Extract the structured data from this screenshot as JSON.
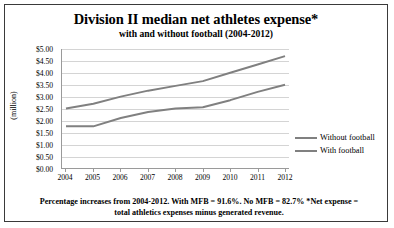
{
  "chart_data": {
    "type": "line",
    "title": "Division II median net athletes expense*",
    "subtitle": "with and without football (2004-2012)",
    "xlabel": "",
    "ylabel": "(million)",
    "categories": [
      "2004",
      "2005",
      "2006",
      "2007",
      "2008",
      "2009",
      "2010",
      "2011",
      "2012"
    ],
    "series": [
      {
        "name": "Without football",
        "color": "#808080",
        "values": [
          2.5,
          2.7,
          3.0,
          3.25,
          3.45,
          3.65,
          4.0,
          4.35,
          4.7
        ]
      },
      {
        "name": "With football",
        "color": "#808080",
        "values": [
          1.75,
          1.75,
          2.1,
          2.35,
          2.5,
          2.55,
          2.85,
          3.2,
          3.5
        ]
      }
    ],
    "ylim": [
      0,
      5
    ],
    "ytick_step": 0.5,
    "ytick_labels": [
      "$5.00",
      "$4.50",
      "$4.00",
      "$3.50",
      "$3.00",
      "$2.50",
      "$2.00",
      "$1.50",
      "$1.00",
      "$0.50",
      "$0.00"
    ],
    "grid": true,
    "legend_position": "right",
    "note": "Percentage increases from 2004-2012. With MFB = 91.6%. No MFB = 82.7% *Net expense = total athletics expenses minus generated revenue."
  }
}
